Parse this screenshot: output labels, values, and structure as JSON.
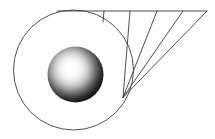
{
  "figure": {
    "title": "Sphere within circle with converging ray fan",
    "canvas": {
      "width": 215,
      "height": 139,
      "background": "#ffffff"
    },
    "stroke_color": "#3b3b3b",
    "stroke_width": 0.9,
    "outer_circle": {
      "name": "outer-circle",
      "cx": 73.5,
      "cy": 70.0,
      "r": 60.0,
      "fill": "none"
    },
    "inner_sphere": {
      "name": "shaded-sphere",
      "cx": 75.5,
      "cy": 74.5,
      "r": 28.0,
      "highlight_cx": 70.0,
      "highlight_cy": 69.0,
      "highlight_color": "#ffffff",
      "mid_color": "#8f8f8f",
      "edge_color": "#000000"
    },
    "horizontal_line": {
      "name": "top-horizontal-line",
      "x1": 57.0,
      "y1": 11.0,
      "x2": 207.0,
      "y2": 11.0
    },
    "convergence_point": {
      "x": 123.0,
      "y": 97.5
    },
    "rays": [
      {
        "name": "ray-1",
        "x_top": 104.0,
        "y_top": 11.0,
        "x_bottom": 103.0,
        "y_bottom": 22.0
      },
      {
        "name": "ray-2",
        "x_top": 130.0,
        "y_top": 11.0,
        "x_bottom": 123.0,
        "y_bottom": 97.5
      },
      {
        "name": "ray-3",
        "x_top": 157.0,
        "y_top": 11.0,
        "x_bottom": 123.0,
        "y_bottom": 97.5
      },
      {
        "name": "ray-4",
        "x_top": 183.0,
        "y_top": 11.0,
        "x_bottom": 123.0,
        "y_bottom": 97.5
      },
      {
        "name": "ray-5",
        "x_top": 207.0,
        "y_top": 11.0,
        "x_bottom": 123.0,
        "y_bottom": 97.5
      }
    ]
  }
}
